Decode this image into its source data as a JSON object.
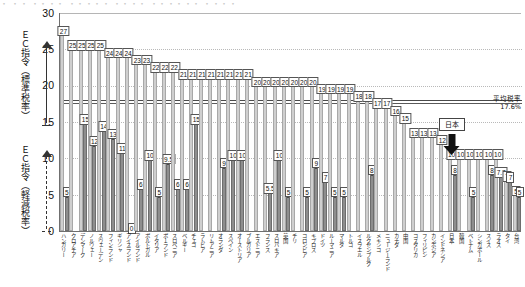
{
  "header_strip": "・ ・・ ・・・・ ・・・・・ ・・・・ ・・・・・・ ・・・・",
  "axis": {
    "y_ticks": [
      "30",
      "25",
      "20",
      "15",
      "10",
      "5",
      "0"
    ],
    "y_min": 0,
    "y_max": 30,
    "gridlines": [
      25,
      20,
      15,
      10,
      5
    ]
  },
  "left_annotations": [
    {
      "name": "ec-directive-standard",
      "text": "ＥＣ指令（標準税率）",
      "range_from": 15,
      "range_to": 25,
      "arrow_style": "solid"
    },
    {
      "name": "ec-directive-reduced",
      "text": "ＥＣ指令（軽減税率）",
      "range_from": 0,
      "range_to": 15,
      "arrow_style": "dashed"
    }
  ],
  "reference_lines": [
    {
      "name": "ec-standard-floor",
      "value": 18,
      "style": "solid"
    },
    {
      "name": "average-rate",
      "value": 17.6,
      "style": "solid"
    }
  ],
  "callouts": {
    "average": {
      "line1": "平均税率",
      "line2": "17.6%",
      "value": 17.6
    },
    "japan": {
      "label": "日本",
      "country_index": 42,
      "standard": 10,
      "reduced": 8
    }
  },
  "legend": {
    "standard_name": "標準税率",
    "reduced_name": "軽減税率"
  },
  "chart_data": {
    "type": "bar",
    "title": "",
    "xlabel": "",
    "ylabel": "",
    "ylim": [
      0,
      30
    ],
    "grid": true,
    "legend_position": "none",
    "categories": [
      "ハンガリー",
      "クロアチア",
      "デンマーク",
      "ノルウェー",
      "スウェーデン",
      "フィンランド",
      "ギリシャ",
      "アイスランド",
      "アイルランド",
      "ポルトガル",
      "イタリア",
      "ポーランド",
      "スロベニア",
      "ベルギー",
      "チェコ",
      "ラトビア",
      "リトアニア",
      "オランダ",
      "スペイン",
      "オーストリア",
      "ブルガリア",
      "エストニア",
      "フランス",
      "スロバキア",
      "英国",
      "チリ",
      "コロンビア",
      "キプロス",
      "ドイツ",
      "ルーマニア",
      "マルタ",
      "トルコ",
      "イスラエル",
      "ルクセンブルク",
      "メキシコ",
      "ニュージーランド",
      "カナダ",
      "中国",
      "コスタリカ",
      "フィリピン",
      "カンボジア",
      "インドネシア",
      "日本",
      "韓国",
      "ベトナム",
      "シンガポール",
      "スイス",
      "ラオス",
      "タイ",
      "台湾"
    ],
    "series": [
      {
        "name": "標準税率",
        "values": [
          27,
          25,
          25,
          25,
          25,
          24,
          24,
          24,
          23,
          23,
          22,
          22,
          22,
          21,
          21,
          21,
          21,
          21,
          21,
          21,
          21,
          20,
          20,
          20,
          20,
          20,
          20,
          20,
          19,
          19,
          19,
          19,
          18,
          18,
          17,
          17,
          16,
          15,
          13,
          13,
          13,
          12,
          10,
          10,
          10,
          10,
          10,
          10,
          7,
          5
        ]
      },
      {
        "name": "軽減税率",
        "values": [
          5,
          null,
          15,
          12,
          14,
          13,
          11,
          0,
          6,
          10,
          5,
          9.5,
          6,
          6,
          15,
          null,
          null,
          9,
          10,
          10,
          null,
          null,
          5.5,
          10,
          5,
          null,
          5,
          9,
          7,
          5,
          5,
          null,
          null,
          8,
          null,
          null,
          null,
          null,
          null,
          null,
          null,
          null,
          8,
          null,
          5,
          null,
          8,
          7.7,
          7,
          5
        ]
      }
    ],
    "standard_labels": [
      "27",
      "25",
      "25",
      "25",
      "25",
      "24",
      "24",
      "24",
      "23",
      "23",
      "22",
      "22",
      "22",
      "21",
      "21",
      "21",
      "21",
      "21",
      "21",
      "21",
      "21",
      "20",
      "20",
      "20",
      "20",
      "20",
      "20",
      "20",
      "19",
      "19",
      "19",
      "19",
      "18",
      "18",
      "17",
      "17",
      "16",
      "15",
      "13",
      "13",
      "13",
      "12",
      "10",
      "10",
      "10",
      "10",
      "10",
      "10",
      "7",
      "5"
    ],
    "reduced_labels": [
      "5",
      "",
      "15",
      "12",
      "14",
      "13",
      "11",
      "0",
      "6",
      "10",
      "5",
      "9.5",
      "6",
      "6",
      "15",
      "",
      "",
      "9",
      "10",
      "10",
      "",
      "",
      "5.5",
      "10",
      "5",
      "",
      "5",
      "9",
      "7",
      "5",
      "5",
      "",
      "",
      "8",
      "",
      "",
      "",
      "",
      "",
      "",
      "",
      "",
      "8",
      "",
      "5",
      "",
      "8",
      "7.7",
      "7",
      "5"
    ],
    "japan_index": 42,
    "annotations": [
      {
        "text": "平均税率 17.6%",
        "at_y": 17.6
      },
      {
        "text": "日本",
        "at_index": 42
      }
    ],
    "colors": {
      "standard_bar": "#cfcfcf",
      "reduced_bar": "#8e8e8e",
      "reference_line": "#4a4a4a",
      "grid": "#b9b9b9"
    }
  }
}
